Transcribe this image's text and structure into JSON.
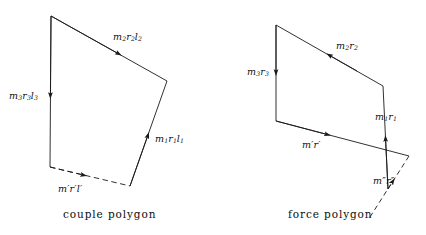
{
  "figure": {
    "background_color": "#ffffff",
    "line_color": "#1a1a1a",
    "text_color": "#111111"
  },
  "couple_polygon": {
    "caption": "couple polygon",
    "labels": {
      "m2r2l2": {
        "m": "m",
        "s1": "2",
        "r": "r",
        "s2": "2",
        "l": "l",
        "s3": "2"
      },
      "m3r3l3": {
        "m": "m",
        "s1": "3",
        "r": "r",
        "s2": "3",
        "l": "l",
        "s3": "3"
      },
      "m1r1l1": {
        "m": "m",
        "s1": "1",
        "r": "r",
        "s2": "1",
        "l": "l",
        "s3": "1"
      },
      "mprime": {
        "text": "m′r′l′"
      }
    },
    "vectors": [
      {
        "name": "m3r3l3",
        "style": "solid",
        "from": [
          51,
          16
        ],
        "to": [
          50,
          167
        ]
      },
      {
        "name": "m2r2l2",
        "from": [
          51,
          16
        ],
        "to": [
          167,
          81
        ],
        "style": "solid"
      },
      {
        "name": "m1r1l1",
        "from": [
          130,
          186
        ],
        "to": [
          167,
          81
        ],
        "style": "solid"
      },
      {
        "name": "mprime",
        "from": [
          50,
          167
        ],
        "to": [
          130,
          186
        ],
        "style": "dashed"
      }
    ]
  },
  "force_polygon": {
    "caption": "force polygon",
    "labels": {
      "m2r2": {
        "m": "m",
        "s1": "2",
        "r": "r",
        "s2": "2"
      },
      "m3r3": {
        "m": "m",
        "s1": "3",
        "r": "r",
        "s2": "3"
      },
      "m1r1": {
        "m": "m",
        "s1": "1",
        "r": "r",
        "s2": "1"
      },
      "mprime": {
        "text": "m′r′"
      },
      "mdprime": {
        "text": "m″r″"
      }
    },
    "vectors": [
      {
        "name": "m3r3",
        "style": "solid",
        "from": [
          276,
          25
        ],
        "to": [
          276,
          121
        ]
      },
      {
        "name": "m2r2",
        "style": "solid",
        "from": [
          276,
          25
        ],
        "to": [
          383,
          86
        ]
      },
      {
        "name": "m1r1",
        "style": "solid",
        "from": [
          388,
          189
        ],
        "to": [
          383,
          86
        ]
      },
      {
        "name": "mprime",
        "style": "solid",
        "from": [
          276,
          121
        ],
        "to": [
          409,
          156
        ]
      },
      {
        "name": "mdprime",
        "style": "dashed",
        "from": [
          388,
          189
        ],
        "to": [
          409,
          156
        ]
      }
    ]
  }
}
